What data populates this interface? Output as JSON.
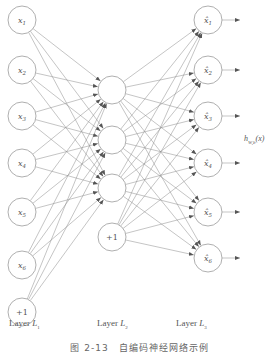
{
  "diagram": {
    "type": "neural-network",
    "layers": [
      {
        "name": "Layer L1",
        "prefix": "Layer ",
        "sub": "L",
        "index": "1",
        "nodes": [
          "x1",
          "x2",
          "x3",
          "x4",
          "x5",
          "x6",
          "+1"
        ]
      },
      {
        "name": "Layer L2",
        "prefix": "Layer ",
        "sub": "L",
        "index": "2",
        "nodes": [
          "",
          "",
          "",
          "+1"
        ]
      },
      {
        "name": "Layer L3",
        "prefix": "Layer ",
        "sub": "L",
        "index": "3",
        "nodes": [
          "x̂1",
          "x̂2",
          "x̂3",
          "x̂4",
          "x̂5",
          "x̂6"
        ]
      }
    ],
    "output_label": "h",
    "output_sub": "W,b",
    "output_arg": "(x)",
    "caption": "图 2-13　自编码神经网络示例"
  },
  "colors": {
    "stroke": "#9a9a9a",
    "edge": "#8a8a8a",
    "text": "#555555"
  }
}
